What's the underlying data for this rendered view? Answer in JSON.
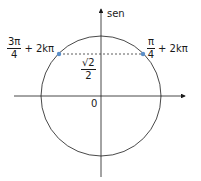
{
  "diagram": {
    "type": "unit-circle",
    "axis_label_vertical": "sen",
    "origin_label": "0",
    "points": [
      {
        "name": "left",
        "num": "3π",
        "den": "4",
        "suffix": "+ 2kπ"
      },
      {
        "name": "right",
        "num": "π",
        "den": "4",
        "suffix": "+ 2kπ"
      }
    ],
    "value_label": {
      "num": "√2",
      "den": "2"
    },
    "colors": {
      "line": "#1a1a1a",
      "point": "#5b8fc9",
      "dash": "#333333"
    }
  }
}
